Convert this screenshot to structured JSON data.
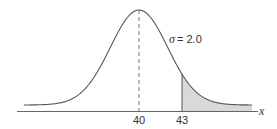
{
  "chart_data": {
    "type": "area",
    "title": "",
    "distribution": "normal",
    "mean": 40,
    "sigma": 2.0,
    "shaded_region": {
      "from": 43,
      "to": "right tail"
    },
    "xlabel": "x",
    "ylabel": "",
    "x_ticks": [
      40,
      43
    ],
    "annotations": [
      "σ = 2.0"
    ],
    "mean_line": "dashed",
    "grid": false,
    "legend": "none",
    "colors": {
      "curve": "#555555",
      "shade": "#d9d9d9",
      "axis": "#666666"
    }
  },
  "labels": {
    "sigma": "σ = 2.0",
    "tick_mean": "40",
    "tick_shade": "43",
    "axis": "x"
  }
}
